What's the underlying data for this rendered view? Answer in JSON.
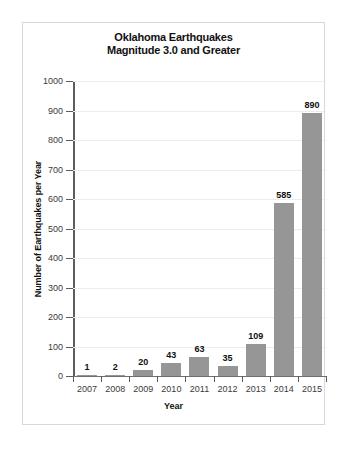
{
  "chart_data": {
    "type": "bar",
    "title": "Oklahoma Earthquakes Magnitude 3.0 and Greater",
    "title_lines": [
      "Oklahoma Earthquakes",
      "Magnitude 3.0 and Greater"
    ],
    "xlabel": "Year",
    "ylabel": "Number of Earthquakes per Year",
    "categories": [
      "2007",
      "2008",
      "2009",
      "2010",
      "2011",
      "2012",
      "2013",
      "2014",
      "2015"
    ],
    "values": [
      1,
      2,
      20,
      43,
      63,
      35,
      109,
      585,
      890
    ],
    "value_labels": [
      "1",
      "2",
      "20",
      "43",
      "63",
      "35",
      "109",
      "585",
      "890"
    ],
    "ylim": [
      0,
      1000
    ],
    "ytick_values": [
      0,
      100,
      200,
      300,
      400,
      500,
      600,
      700,
      800,
      900,
      1000
    ],
    "ytick_labels": [
      "0",
      "100",
      "200",
      "300",
      "400",
      "500",
      "600",
      "700",
      "800",
      "900",
      "1000"
    ],
    "grid": true,
    "legend": null,
    "bar_color": "#969696",
    "gridline_color": "#ececec",
    "axis_color": "#5d5d5d",
    "text_color": "#111111",
    "background": "#ffffff",
    "border_color": "#d8d8d8"
  }
}
